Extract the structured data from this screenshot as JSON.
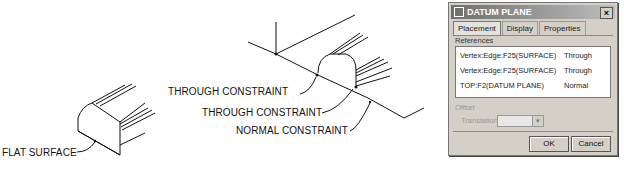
{
  "callouts": {
    "flat_surface": "FLAT SURFACE",
    "through_constraint_1": "THROUGH CONSTRAINT",
    "through_constraint_2": "THROUGH CONSTRAINT",
    "normal_constraint": "NORMAL CONSTRAINT"
  },
  "dialog": {
    "title": "DATUM PLANE",
    "close_icon": "close-icon",
    "tabs": [
      {
        "label": "Placement",
        "active": true
      },
      {
        "label": "Display",
        "active": false
      },
      {
        "label": "Properties",
        "active": false
      }
    ],
    "references_label": "References",
    "references": [
      {
        "name": "Vertex:Edge:F25(SURFACE)",
        "type": "Through"
      },
      {
        "name": "Vertex:Edge:F25(SURFACE)",
        "type": "Through"
      },
      {
        "name": "TOP:F2(DATUM PLANE)",
        "type": "Normal"
      }
    ],
    "offset_label": "Offset",
    "translation_label": "Translation",
    "translation_value": "",
    "ok_label": "OK",
    "cancel_label": "Cancel"
  }
}
